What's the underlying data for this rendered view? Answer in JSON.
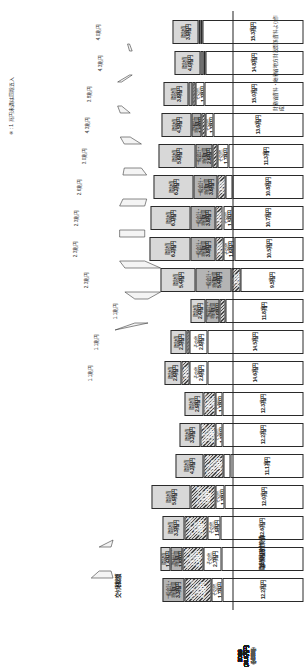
{
  "figure": {
    "axis_title": "国税収入等の内訳",
    "group_label_left": "交付税\n総額",
    "group_label_bottom": "臨時財政対策債",
    "note": "※ : 1 兆円未満は四捨五入",
    "source": "財務省資料・総務省地方財政関係資料より作成",
    "unit": "兆円"
  },
  "legend": {
    "items": [
      {
        "name": "法定率分",
        "fill": "fill-white"
      },
      {
        "name": "その他",
        "fill": "fill-white"
      },
      {
        "name": "一般会計・特例加算",
        "fill": "fill-midgray"
      },
      {
        "name": "借入金・特例措置",
        "fill": "fill-hatch"
      },
      {
        "name": "臨時財政対策債",
        "fill": "fill-lightgray"
      }
    ]
  },
  "chart_data": {
    "type": "bar",
    "xlabel": "年度",
    "ylabel": "金額（兆円）",
    "unit": "兆円",
    "categories": [
      "2000",
      "2001",
      "2002",
      "2003",
      "2004",
      "2005",
      "2006",
      "2007",
      "2008",
      "2009",
      "2010",
      "2011",
      "2012",
      "2013",
      "2014",
      "2015",
      "2016",
      "2017",
      "2018"
    ],
    "totals": [
      21.4,
      21.3,
      21.8,
      22.2,
      20.8,
      21.1,
      20.1,
      18.8,
      17.8,
      18.2,
      21.0,
      24.6,
      23.5,
      23.6,
      23.3,
      22.5,
      21.3,
      20.5,
      20.4
    ],
    "totals_display": [
      "(21.4兆円)",
      "(21.3兆円)",
      "(21.8兆円)",
      "(22.2兆円)",
      "(20.8兆円)",
      "(21.1兆円)",
      "(20.1兆円)",
      "(18.8兆円)",
      "(17.8兆円)",
      "(18.2兆円)",
      "(21.0兆円)",
      "(24.6兆円)",
      "(23.5兆円)",
      "(23.6兆円)",
      "(23.3兆円)",
      "(22.5兆円)",
      "(21.3兆円)",
      "(20.5兆円)",
      "(20.4兆円)"
    ],
    "growth_display": [
      "(+3.4%)",
      "(-0.5%)",
      "(+2.3%)",
      "(+1.8%)",
      "(-6.3%)",
      "(+1.4%)",
      "(-4.7%)",
      "(-6.5%)",
      "(-5.3%)",
      "(+2.2%)",
      "(+15.4%)",
      "(+17.1%)",
      "(-4.5%)",
      "(+0.4%)",
      "(-1.3%)",
      "(-3.4%)",
      "(-5.3%)",
      "(-3.8%)",
      "(-0.5%)"
    ],
    "series": [
      {
        "name": "法定率分",
        "fill": "fill-white",
        "values": [
          12.2,
          12.5,
          12.6,
          12.0,
          11.1,
          12.2,
          12.3,
          14.6,
          14.5,
          11.8,
          9.5,
          10.5,
          10.7,
          10.8,
          11.3,
          13.6,
          15.0,
          14.8,
          15.3
        ],
        "labels": [
          "12.2兆円",
          "12.5兆円",
          "12.6兆円",
          "12.0兆円",
          "11.1兆円",
          "12.2兆円",
          "12.3兆円",
          "14.6兆円",
          "14.5兆円",
          "11.8兆円",
          "9.5兆円",
          "10.5兆円",
          "10.7兆円",
          "10.8兆円",
          "11.3兆円",
          "13.6兆円",
          "15.0兆円",
          "14.8兆円",
          "15.3兆円"
        ]
      },
      {
        "name": "その他",
        "fill": "fill-white",
        "values": [
          1.7,
          2.7,
          1.9,
          1.3,
          1.0,
          1.1,
          1.1,
          2.6,
          2.8,
          0.0,
          0.0,
          1.6,
          1.5,
          1.0,
          1.7,
          1.3,
          1.3,
          0.0,
          0.0
        ],
        "labels": [
          "その他 1.7兆円",
          "その他 2.7兆円",
          "その他 1.9兆円",
          "その他 1.3兆円",
          "その他 1.0兆円",
          "その他 1.1兆円",
          "その他 1.1兆円",
          "その他 2.6兆円",
          "その他 2.8兆円",
          "",
          "",
          "その他 1.6兆円",
          "その他 1.5兆円",
          "その他 1.0兆円",
          "その他 1.7兆円",
          "その他 1.3兆円",
          "その他 1.3兆円",
          "",
          ""
        ]
      },
      {
        "name": "借入金・特例措置",
        "fill": "fill-hatch",
        "values": [
          4.2,
          3.2,
          3.6,
          3.8,
          3.1,
          2.3,
          1.7,
          1.3,
          0.5,
          1.0,
          1.4,
          1.2,
          1.1,
          1.2,
          0.8,
          0.6,
          0.5,
          0.4,
          0.3
        ],
        "labels": [
          "借入金・特例措置 4.2兆円",
          "借入金・特例措置 3.2兆円",
          "借入金・特例措置 3.6兆円",
          "借入金・特例措置 3.8兆円",
          "借入金・特例措置 3.1兆円",
          "借入金・特例措置 2.3兆円",
          "借入金・特例措置 1.7兆円",
          "借入金・特例措置 1.3兆円",
          "借入金・特例措置 0.5兆円",
          "借入金・特例措置 1.0兆円",
          "借入金・特例措置 1.4兆円",
          "借入金・特例措置 1.2兆円",
          "借入金・特例措置 1.1兆円",
          "借入金・特例措置 1.2兆円",
          "借入金・特例措置 0.8兆円",
          "借入金・特例措置 0.6兆円",
          "借入金・特例措置 0.5兆円",
          "借入金・特例措置 0.4兆円",
          "借入金・特例措置 0.3兆円"
        ]
      },
      {
        "name": "一般会計・特例加算",
        "fill": "fill-midgray",
        "values": [
          3.3,
          1.8,
          0.0,
          0.0,
          0.0,
          0.0,
          0.0,
          0.0,
          0.0,
          2.0,
          5.4,
          3.8,
          3.8,
          3.6,
          2.6,
          1.5,
          0.6,
          0.4,
          0.3
        ],
        "labels": [
          "一般会計・特例加算 3.3兆円",
          "一般会計・特例加算 1.8兆円",
          "",
          "",
          "",
          "",
          "",
          "",
          "",
          "一般会計・特例加算 2.0兆円",
          "一般会計・特例加算 5.4兆円",
          "一般会計・特例加算 3.8兆円",
          "一般会計・特例加算 3.8兆円",
          "一般会計・特例加算 3.6兆円",
          "一般会計・特例加算 2.6兆円",
          "一般会計・特例加算 1.5兆円",
          "一般会計・特例加算 0.6兆円",
          "一般会計・特例加算 0.4兆円",
          "一般会計・特例加算 0.3兆円"
        ]
      },
      {
        "name": "臨時財政対策債",
        "fill": "fill-lightgray",
        "values": [
          0.0,
          1.4,
          3.3,
          5.9,
          4.2,
          3.2,
          2.9,
          2.6,
          2.3,
          2.4,
          5.4,
          6.2,
          6.1,
          6.2,
          5.6,
          4.5,
          3.8,
          4.0,
          3.9
        ],
        "labels": [
          "",
          "臨財債 1.4兆円",
          "臨財債 3.3兆円",
          "臨財債 5.9兆円",
          "臨財債 4.2兆円",
          "臨財債 3.2兆円",
          "臨財債 2.9兆円",
          "臨財債 2.6兆円",
          "臨財債 2.3兆円",
          "臨財債 2.4兆円",
          "臨財債 5.4兆円",
          "臨財債 6.2兆円",
          "臨財債 6.1兆円",
          "臨財債 6.2兆円",
          "臨財債 5.6兆円",
          "臨財債 4.5兆円",
          "臨財債 3.8兆円",
          "臨財債 4.0兆円",
          "臨財債 3.9兆円"
        ]
      }
    ],
    "outer_values": [
      "3.3兆円",
      "1.3兆円",
      "2.5兆円",
      "3.2兆円",
      "2.2兆円",
      "2.0兆円",
      "2.2兆円",
      "2.6兆円",
      "2.8兆円",
      "2.4兆円",
      "2.3兆円",
      "2.3兆円",
      "2.6兆円",
      "3.0兆円",
      "3.0兆円",
      "3.1兆円",
      "3.5兆円",
      "3.4兆円",
      "3.8兆円"
    ],
    "outer_values_small": [
      "",
      "",
      "",
      "",
      "",
      "",
      "",
      "1.1兆円",
      "1.1兆円",
      "1.1兆円",
      "2.3兆円",
      "2.3兆円",
      "2.3兆円",
      "2.6兆円",
      "3.0兆円",
      "4.3兆円",
      "3.8兆円",
      "4.3兆円",
      "4.0兆円"
    ],
    "ylim": [
      0,
      26
    ],
    "grid": false,
    "legend_position": "bottom-right"
  }
}
